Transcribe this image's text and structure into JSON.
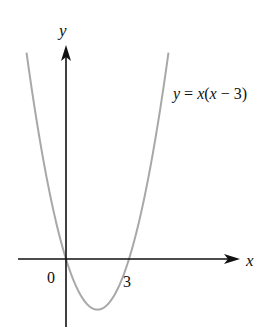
{
  "chart_data": {
    "type": "line",
    "title": "",
    "xlabel": "x",
    "ylabel": "y",
    "equation_label": "y = x(x − 3)",
    "series": [
      {
        "name": "y = x(x − 3)",
        "function": "x*(x-3)",
        "x": [
          -2,
          -1,
          0,
          1,
          1.5,
          2,
          3,
          4,
          4.9
        ],
        "values": [
          10,
          4,
          0,
          -2,
          -2.25,
          -2,
          0,
          4,
          9.31
        ]
      }
    ],
    "tick_labels": [
      {
        "x": 0,
        "label": "0"
      },
      {
        "x": 3,
        "label": "3"
      }
    ],
    "roots": [
      0,
      3
    ],
    "vertex": [
      1.5,
      -2.25
    ],
    "grid": false,
    "legend": "none",
    "colors": {
      "axis": "#111111",
      "curve": "#a8a8a8",
      "text": "#111111"
    }
  },
  "labels": {
    "y_axis": "y",
    "x_axis": "x",
    "origin": "0",
    "root_3": "3",
    "equation_prefix": "y = x(x − 3)"
  }
}
